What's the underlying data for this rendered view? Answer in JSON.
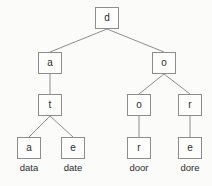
{
  "diagram": {
    "type": "trie-tree",
    "title": "",
    "canvas": {
      "width": 212,
      "height": 186,
      "background": "#fbfbfa"
    },
    "style": {
      "node_border": "#8d8d8d",
      "node_fill": "#fdfdfc",
      "edge_color": "#8d8d8d",
      "text_color": "#2b2b2b"
    },
    "nodes": [
      {
        "id": "n0",
        "label": "d",
        "x": 95,
        "y": 7,
        "level": 0
      },
      {
        "id": "n1",
        "label": "a",
        "x": 38,
        "y": 52,
        "level": 1
      },
      {
        "id": "n2",
        "label": "o",
        "x": 152,
        "y": 52,
        "level": 1
      },
      {
        "id": "n3",
        "label": "t",
        "x": 38,
        "y": 94,
        "level": 2
      },
      {
        "id": "n4",
        "label": "o",
        "x": 127,
        "y": 94,
        "level": 2
      },
      {
        "id": "n5",
        "label": "r",
        "x": 178,
        "y": 94,
        "level": 2
      },
      {
        "id": "n6",
        "label": "a",
        "x": 17,
        "y": 137,
        "level": 3
      },
      {
        "id": "n7",
        "label": "e",
        "x": 61,
        "y": 137,
        "level": 3
      },
      {
        "id": "n8",
        "label": "r",
        "x": 127,
        "y": 137,
        "level": 3
      },
      {
        "id": "n9",
        "label": "e",
        "x": 178,
        "y": 137,
        "level": 3
      }
    ],
    "edges": [
      {
        "from": "n0",
        "to": "n1"
      },
      {
        "from": "n0",
        "to": "n2"
      },
      {
        "from": "n1",
        "to": "n3"
      },
      {
        "from": "n2",
        "to": "n4"
      },
      {
        "from": "n2",
        "to": "n5"
      },
      {
        "from": "n3",
        "to": "n6"
      },
      {
        "from": "n3",
        "to": "n7"
      },
      {
        "from": "n4",
        "to": "n8"
      },
      {
        "from": "n5",
        "to": "n9"
      }
    ],
    "word_labels": [
      {
        "id": "w0",
        "text": "data",
        "x": 6,
        "y": 163
      },
      {
        "id": "w1",
        "text": "date",
        "x": 50,
        "y": 163
      },
      {
        "id": "w2",
        "text": "door",
        "x": 116,
        "y": 163
      },
      {
        "id": "w3",
        "text": "dore",
        "x": 167,
        "y": 163
      }
    ]
  }
}
